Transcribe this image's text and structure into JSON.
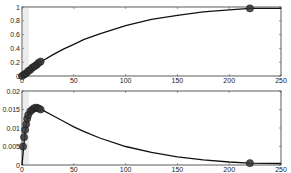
{
  "chart_data": [
    {
      "type": "line",
      "title": "",
      "xlabel": "",
      "ylabel": "",
      "xlim": [
        0,
        250
      ],
      "ylim": [
        0,
        1
      ],
      "x_ticks": [
        0,
        50,
        100,
        150,
        200,
        250
      ],
      "y_ticks": [
        0,
        0.2,
        0.4,
        0.6,
        0.8,
        1
      ],
      "y_tick_labels": [
        "0",
        "0.2",
        "0.4",
        "0.6",
        "0.8",
        "1"
      ],
      "grid": false,
      "series": [
        {
          "name": "curve",
          "style": "solid line",
          "x": [
            0,
            5,
            10,
            15,
            20,
            30,
            40,
            50,
            60,
            75,
            100,
            125,
            150,
            175,
            200,
            220,
            250
          ],
          "y": [
            0,
            0.06,
            0.12,
            0.17,
            0.22,
            0.31,
            0.39,
            0.46,
            0.53,
            0.61,
            0.73,
            0.82,
            0.88,
            0.93,
            0.96,
            0.98,
            0.98
          ]
        },
        {
          "name": "markers",
          "style": "filled circles",
          "x": [
            0,
            2,
            4,
            6,
            8,
            10,
            12,
            14,
            16,
            18,
            220
          ],
          "y": [
            0,
            0.02,
            0.04,
            0.07,
            0.09,
            0.12,
            0.14,
            0.16,
            0.19,
            0.21,
            0.98
          ]
        }
      ]
    },
    {
      "type": "line",
      "title": "",
      "xlabel": "",
      "ylabel": "",
      "xlim": [
        0,
        250
      ],
      "ylim": [
        0,
        0.02
      ],
      "x_ticks": [
        0,
        50,
        100,
        150,
        200,
        250
      ],
      "y_ticks": [
        0,
        0.005,
        0.01,
        0.015,
        0.02
      ],
      "y_tick_labels": [
        "0",
        "0.005",
        "0.01",
        "0.015",
        "0.02"
      ],
      "grid": false,
      "series": [
        {
          "name": "curve",
          "style": "solid line",
          "x": [
            0,
            3,
            6,
            10,
            15,
            20,
            30,
            40,
            50,
            60,
            75,
            100,
            125,
            150,
            175,
            200,
            220,
            250
          ],
          "y": [
            0,
            0.009,
            0.0135,
            0.0152,
            0.0155,
            0.0148,
            0.0133,
            0.0118,
            0.0103,
            0.009,
            0.0073,
            0.005,
            0.0034,
            0.0022,
            0.0014,
            0.0008,
            0.0005,
            0.0004
          ]
        },
        {
          "name": "markers",
          "style": "filled circles",
          "x": [
            1,
            2,
            3,
            4,
            5,
            6,
            8,
            10,
            12,
            14,
            16,
            18,
            220
          ],
          "y": [
            0.005,
            0.0075,
            0.0095,
            0.011,
            0.0125,
            0.0135,
            0.0145,
            0.015,
            0.0154,
            0.0155,
            0.0153,
            0.015,
            0.0005
          ]
        }
      ]
    }
  ]
}
